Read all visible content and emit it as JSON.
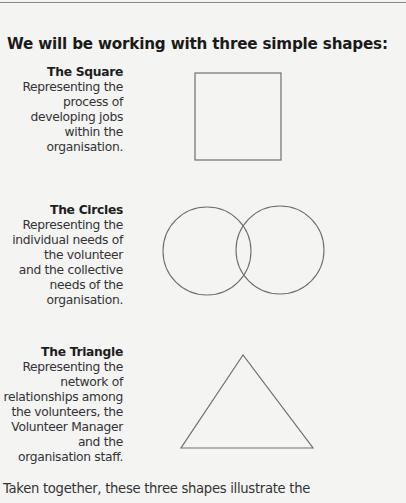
{
  "heading": "We will be working with three simple shapes:",
  "shapes": [
    {
      "title": "The Square",
      "lines": [
        "Representing the",
        "process of",
        "developing jobs",
        "within the",
        "organisation."
      ],
      "icon": "square-icon"
    },
    {
      "title": "The Circles",
      "lines": [
        "Representing the",
        "individual needs of",
        "the volunteer",
        "and the collective",
        "needs of the",
        "organisation."
      ],
      "icon": "overlapping-circles-icon"
    },
    {
      "title": "The Triangle",
      "lines": [
        "Representing the",
        "network of",
        "relationships among",
        "the volunteers, the",
        "Volunteer Manager",
        "and the",
        "organisation staff."
      ],
      "icon": "triangle-icon"
    }
  ],
  "footer": "Taken together, these three shapes illustrate the",
  "colors": {
    "background": "#f4f4f3",
    "text": "#333333",
    "shape_stroke": "#6e6e6e"
  }
}
